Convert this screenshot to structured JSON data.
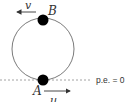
{
  "diagram": {
    "type": "vertical-circle-motion",
    "labels": {
      "top_point": "B",
      "bottom_point": "A",
      "top_velocity": "v",
      "bottom_velocity": "u",
      "reference_line": "p.e. = 0"
    },
    "colors": {
      "circle": "#6b6b6b",
      "ball": "#000000",
      "arrow": "#333333",
      "dashed_line": "#8a8a8a",
      "text": "#333333"
    }
  }
}
